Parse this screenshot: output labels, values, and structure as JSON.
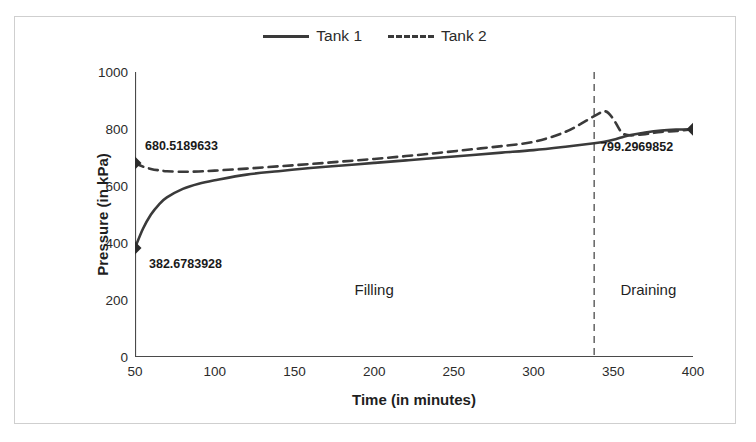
{
  "chart_data": {
    "type": "line",
    "title": "",
    "xlabel": "Time (in minutes)",
    "ylabel": "Pressure (in kPa)",
    "xlim": [
      50,
      400
    ],
    "ylim": [
      0,
      1000
    ],
    "xticks": [
      50,
      100,
      150,
      200,
      250,
      300,
      350,
      400
    ],
    "yticks": [
      0,
      200,
      400,
      600,
      800,
      1000
    ],
    "grid": false,
    "legend_position": "top-center",
    "series": [
      {
        "name": "Tank 1",
        "style": "solid",
        "color": "#3a3a3a",
        "x": [
          50,
          55,
          60,
          65,
          70,
          80,
          90,
          100,
          120,
          140,
          160,
          180,
          200,
          220,
          240,
          260,
          280,
          300,
          320,
          338,
          345,
          350,
          355,
          360,
          370,
          380,
          390,
          400
        ],
        "y": [
          382.68,
          450,
          500,
          535,
          560,
          590,
          608,
          620,
          640,
          652,
          663,
          672,
          681,
          690,
          699,
          708,
          717,
          726,
          738,
          750,
          756,
          762,
          770,
          778,
          788,
          795,
          798,
          799.3
        ]
      },
      {
        "name": "Tank 2",
        "style": "dashed",
        "color": "#3a3a3a",
        "x": [
          50,
          55,
          60,
          65,
          70,
          80,
          90,
          100,
          120,
          140,
          160,
          180,
          200,
          220,
          240,
          260,
          280,
          300,
          320,
          338,
          345,
          350,
          355,
          360,
          370,
          380,
          390,
          400
        ],
        "y": [
          680.52,
          668,
          660,
          655,
          652,
          650,
          651,
          654,
          661,
          669,
          677,
          686,
          695,
          705,
          716,
          728,
          740,
          755,
          790,
          845,
          862,
          835,
          790,
          778,
          782,
          790,
          793,
          799.3
        ]
      }
    ],
    "markers": [
      {
        "x": 50,
        "y": 680.52,
        "label": "680.5189633"
      },
      {
        "x": 50,
        "y": 382.68,
        "label": "382.6783928"
      },
      {
        "x": 400,
        "y": 799.3,
        "label": "799.2969852"
      }
    ],
    "annotations": [
      {
        "text": "Filling",
        "x": 200,
        "y": 265
      },
      {
        "text": "Draining",
        "x": 372,
        "y": 265
      }
    ],
    "vertical_divider": {
      "x": 338,
      "style": "dashed"
    }
  },
  "legend": {
    "entries": [
      {
        "label": "Tank 1",
        "style": "solid"
      },
      {
        "label": "Tank 2",
        "style": "dashed"
      }
    ]
  }
}
